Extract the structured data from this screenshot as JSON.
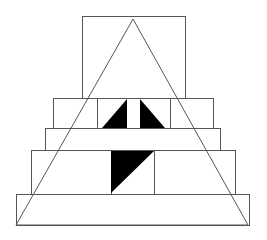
{
  "diagram": {
    "colors": {
      "background": "#ffffff",
      "stroke": "#555555",
      "fill_dark": "#000000"
    },
    "canvas": {
      "width": 267,
      "height": 240
    },
    "tiers": [
      {
        "name": "top-box",
        "x": 82,
        "y": 16,
        "w": 103,
        "h": 82
      },
      {
        "name": "tier-1",
        "x": 53,
        "y": 98,
        "w": 160,
        "h": 30,
        "dividers_x": [
          97,
          170
        ]
      },
      {
        "name": "tier-2",
        "x": 45,
        "y": 128,
        "w": 175,
        "h": 22
      },
      {
        "name": "tier-3",
        "x": 31,
        "y": 150,
        "w": 204,
        "h": 44,
        "dividers_x": [
          111,
          154
        ]
      },
      {
        "name": "tier-4",
        "x": 16,
        "y": 194,
        "w": 233,
        "h": 31
      }
    ],
    "big_triangle": {
      "points": "133,19 16,225 248,225"
    },
    "black_shapes": [
      {
        "name": "tier-1-left-black-triangle",
        "points": "102,128 127,128 127,99"
      },
      {
        "name": "tier-1-right-black-triangle",
        "points": "140,99 140,128 165,128"
      },
      {
        "name": "tier-3-black-triangle",
        "points": "111,151 154,151 111,193"
      }
    ]
  }
}
